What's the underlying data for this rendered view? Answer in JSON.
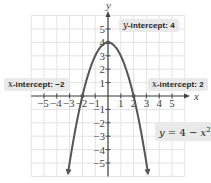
{
  "chart_data": {
    "type": "line",
    "title": "",
    "function": "y = 4 - x^2",
    "xlabel": "x",
    "ylabel": "y",
    "xlim": [
      -6,
      6
    ],
    "ylim": [
      -6,
      6
    ],
    "grid": true,
    "x_ticks": [
      -5,
      -4,
      -3,
      -2,
      -1,
      1,
      2,
      3,
      4,
      5
    ],
    "y_ticks": [
      -5,
      -4,
      -3,
      -2,
      -1,
      1,
      2,
      3,
      4,
      5
    ],
    "series": [
      {
        "name": "y = 4 - x²",
        "x": [
          -3,
          -2,
          -1,
          0,
          1,
          2,
          3
        ],
        "y": [
          -5,
          0,
          3,
          4,
          3,
          0,
          -5
        ]
      }
    ],
    "points": [
      {
        "x": -2,
        "y": 0,
        "label": "x-intercept: -2"
      },
      {
        "x": 2,
        "y": 0,
        "label": "x-intercept: 2"
      },
      {
        "x": 0,
        "y": 4,
        "label": "y-intercept: 4"
      }
    ],
    "annotations": [
      "y-intercept: 4",
      "x-intercept: −2",
      "x-intercept: 2",
      "y = 4 − x²"
    ]
  },
  "labels": {
    "y_intercept": {
      "var": "y",
      "text": "-intercept: 4"
    },
    "x_intercept_neg": {
      "var": "x",
      "text": "-intercept: −2"
    },
    "x_intercept_pos": {
      "var": "x",
      "text": "-intercept: 2"
    },
    "equation": {
      "lhs": "y",
      "mid": " = 4 − ",
      "var": "x",
      "exp": "2"
    }
  },
  "axes": {
    "x_name": "x",
    "y_name": "y",
    "x_tick_labels": [
      "−5",
      "−4",
      "−3",
      "−2",
      "−1",
      "1",
      "2",
      "3",
      "4",
      "5"
    ],
    "y_tick_labels": [
      "5",
      "4",
      "3",
      "2",
      "1",
      "−1",
      "−2",
      "−3",
      "−4",
      "−5"
    ]
  },
  "colors": {
    "curve": "#555555",
    "grid": "#e3e3e3",
    "axis": "#444444",
    "label_bg": "#e9e9e9"
  }
}
